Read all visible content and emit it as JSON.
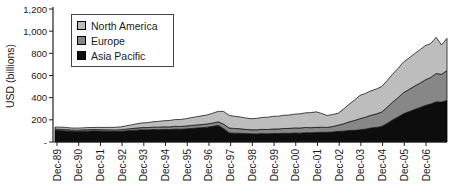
{
  "figure": {
    "width": 455,
    "height": 196,
    "background": "#ffffff"
  },
  "y_axis": {
    "label": "USD (billions)",
    "tick_labels": [
      "1,200",
      "1,000",
      "800",
      "600",
      "400",
      "200",
      "-"
    ],
    "tick_values": [
      1200,
      1000,
      800,
      600,
      400,
      200,
      0
    ]
  },
  "x_axis": {
    "tick_labels": [
      "Dec-89",
      "Dec-90",
      "Dec-91",
      "Dec-92",
      "Dec-93",
      "Dec-94",
      "Dec-95",
      "Dec-96",
      "Dec-97",
      "Dec-98",
      "Dec-99",
      "Dec-00",
      "Dec-01",
      "Dec-02",
      "Dec-03",
      "Dec-04",
      "Dec-05",
      "Dec-06"
    ]
  },
  "legend": {
    "items": [
      {
        "label": "North America",
        "color": "#bdbdbd"
      },
      {
        "label": "Europe",
        "color": "#878787"
      },
      {
        "label": "Asia Pacific",
        "color": "#0d0d0d"
      }
    ]
  },
  "chart_data": {
    "type": "area",
    "stacked": true,
    "title": "",
    "xlabel": "",
    "ylabel": "USD (billions)",
    "ylim": [
      0,
      1200
    ],
    "grid": false,
    "legend_position": "top-left",
    "x_start": "Dec-89",
    "x_end": "Dec-07",
    "x_interval": "quarterly",
    "x_tick_labels": [
      "Dec-89",
      "Dec-90",
      "Dec-91",
      "Dec-92",
      "Dec-93",
      "Dec-94",
      "Dec-95",
      "Dec-96",
      "Dec-97",
      "Dec-98",
      "Dec-99",
      "Dec-00",
      "Dec-01",
      "Dec-02",
      "Dec-03",
      "Dec-04",
      "Dec-05",
      "Dec-06"
    ],
    "series": [
      {
        "name": "Asia Pacific",
        "color": "#0d0d0d",
        "edge": "#000000",
        "values": [
          105,
          103,
          100,
          96,
          95,
          97,
          98,
          100,
          99,
          97,
          96,
          94,
          96,
          100,
          104,
          107,
          110,
          109,
          112,
          111,
          113,
          112,
          116,
          115,
          118,
          122,
          126,
          129,
          133,
          141,
          150,
          120,
          82,
          80,
          79,
          76,
          74,
          73,
          76,
          74,
          77,
          76,
          79,
          78,
          81,
          80,
          84,
          83,
          86,
          88,
          87,
          90,
          96,
          98,
          104,
          105,
          110,
          116,
          126,
          131,
          140,
          168,
          199,
          225,
          255,
          273,
          293,
          310,
          330,
          342,
          362,
          360,
          375
        ]
      },
      {
        "name": "Europe",
        "color": "#878787",
        "edge": "#1a1a1a",
        "values": [
          12,
          12,
          13,
          12,
          12,
          12,
          13,
          12,
          13,
          13,
          14,
          14,
          15,
          16,
          17,
          19,
          20,
          21,
          22,
          23,
          24,
          24,
          25,
          25,
          26,
          27,
          28,
          29,
          30,
          31,
          32,
          40,
          44,
          42,
          40,
          38,
          36,
          37,
          38,
          39,
          40,
          41,
          43,
          44,
          46,
          46,
          47,
          46,
          46,
          45,
          44,
          50,
          55,
          66,
          77,
          89,
          100,
          107,
          115,
          122,
          130,
          145,
          160,
          175,
          190,
          200,
          210,
          220,
          230,
          240,
          256,
          250,
          270
        ]
      },
      {
        "name": "North America",
        "color": "#bdbdbd",
        "edge": "#1a1a1a",
        "values": [
          18,
          19,
          18,
          18,
          18,
          18,
          19,
          19,
          20,
          21,
          22,
          24,
          25,
          29,
          33,
          38,
          42,
          45,
          48,
          52,
          55,
          58,
          61,
          63,
          66,
          70,
          74,
          78,
          82,
          88,
          95,
          115,
          114,
          110,
          107,
          103,
          100,
          103,
          107,
          110,
          114,
          116,
          119,
          121,
          124,
          128,
          132,
          136,
          140,
          124,
          108,
          108,
          108,
          133,
          159,
          184,
          210,
          215,
          220,
          225,
          230,
          241,
          252,
          264,
          275,
          284,
          293,
          301,
          310,
          305,
          327,
          265,
          290
        ]
      }
    ]
  }
}
